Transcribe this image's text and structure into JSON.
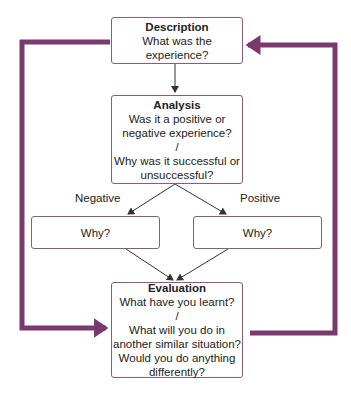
{
  "description": {
    "title": "Description",
    "lines": [
      "What was the",
      "experience?"
    ]
  },
  "analysis": {
    "title": "Analysis",
    "lines": [
      "Was it a positive or",
      "negative experience?",
      "/",
      "Why was it successful or",
      "unsuccessful?"
    ]
  },
  "branches": {
    "negative_label": "Negative",
    "positive_label": "Positive"
  },
  "negative_box": {
    "text": "Why?"
  },
  "positive_box": {
    "text": "Why?"
  },
  "evaluation": {
    "title": "Evaluation",
    "lines": [
      "What have you learnt?",
      "/",
      "What will you do in",
      "another similar situation?",
      "Would you do anything",
      "differently?"
    ]
  },
  "colors": {
    "loop": "#7b3a6e",
    "border": "#8a5a80",
    "arrow": "#333333"
  }
}
